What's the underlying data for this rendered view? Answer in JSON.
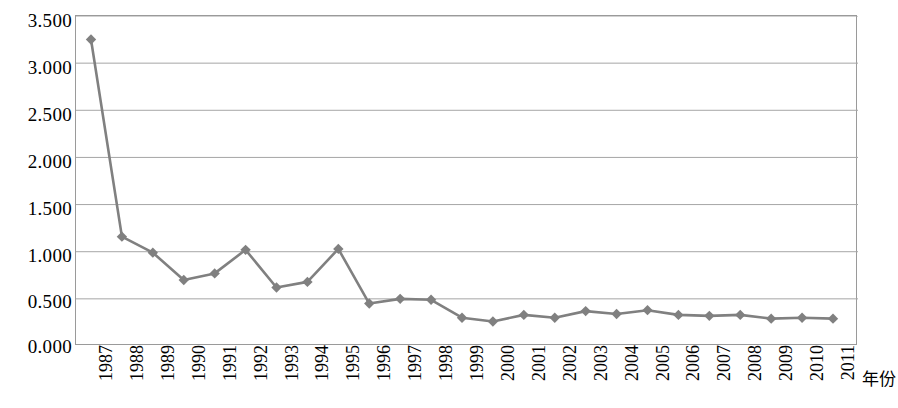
{
  "chart_data": {
    "type": "line",
    "title": "",
    "subtitle": "",
    "xlabel": "年份",
    "ylabel": "",
    "categories": [
      "1987",
      "1988",
      "1989",
      "1990",
      "1991",
      "1992",
      "1993",
      "1994",
      "1995",
      "1996",
      "1997",
      "1998",
      "1999",
      "2000",
      "2001",
      "2002",
      "2003",
      "2004",
      "2005",
      "2006",
      "2007",
      "2008",
      "2009",
      "2010",
      "2011"
    ],
    "values": [
      3.25,
      1.16,
      0.99,
      0.7,
      0.77,
      1.02,
      0.62,
      0.68,
      1.03,
      0.45,
      0.5,
      0.49,
      0.3,
      0.26,
      0.33,
      0.3,
      0.37,
      0.34,
      0.38,
      0.33,
      0.32,
      0.33,
      0.29,
      0.3,
      0.29
    ],
    "ylim": [
      0.0,
      3.5
    ],
    "y_ticks": [
      "0.000",
      "0.500",
      "1.000",
      "1.500",
      "2.000",
      "2.500",
      "3.000",
      "3.500"
    ],
    "y_tick_values": [
      0.0,
      0.5,
      1.0,
      1.5,
      2.0,
      2.5,
      3.0,
      3.5
    ],
    "grid": true,
    "grid_axis": "y",
    "legend": false,
    "legend_position": "none",
    "marker": "diamond",
    "series_color": "#808080",
    "grid_color": "#a6a6a6",
    "border_color": "#9a9a9a",
    "annotations": []
  },
  "axis": {
    "x_title": "年份"
  }
}
